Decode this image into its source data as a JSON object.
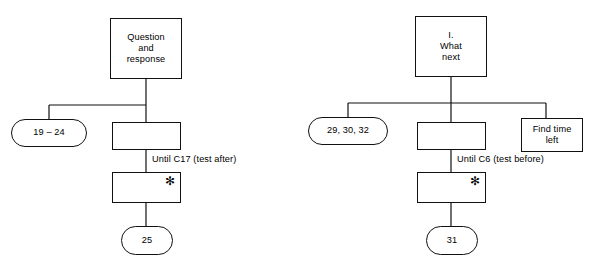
{
  "figure": {
    "background_color": "#ffffff",
    "line_color": "#111111",
    "text_color": "#000000",
    "asterisk_glyph": "✻"
  },
  "diagrams": [
    {
      "id": "left-tree",
      "root": {
        "label": "Question\nand\nresponse"
      },
      "branch_left": {
        "label": "19 – 24"
      },
      "branch_center": {
        "label": ""
      },
      "loop_label": {
        "text": "Until C17 (test after)"
      },
      "loop_body": {
        "label": "",
        "marker": "✻"
      },
      "terminal": {
        "label": "25"
      }
    },
    {
      "id": "right-tree",
      "root": {
        "label": "I.\nWhat\nnext"
      },
      "branch_left": {
        "label": "29, 30, 32"
      },
      "branch_center": {
        "label": ""
      },
      "branch_right": {
        "label": "Find time\nleft"
      },
      "loop_label": {
        "text": "Until C6 (test before)"
      },
      "loop_body": {
        "label": "",
        "marker": "✻"
      },
      "terminal": {
        "label": "31"
      }
    }
  ]
}
